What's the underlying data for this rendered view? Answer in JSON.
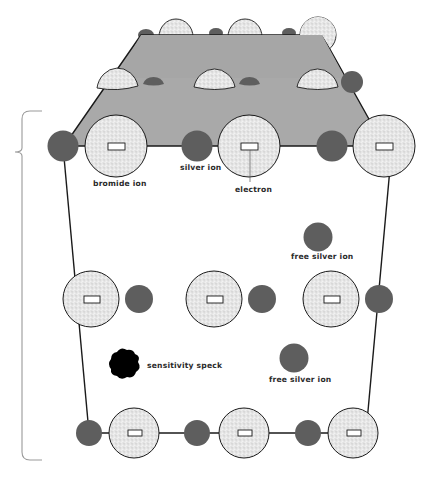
{
  "diagram": {
    "colors": {
      "silver_ion": "#5e5e5e",
      "bromide_ion_fill": "#ebebeb",
      "surface": "#a9a9a9",
      "outline": "#1a1a1a",
      "speck": "#000000",
      "brace": "#9a9a9a"
    },
    "labels": {
      "bromide_ion": "bromide ion",
      "silver_ion": "silver ion",
      "electron": "electron",
      "free_silver_ion_1": "free silver ion",
      "free_silver_ion_2": "free silver ion",
      "sensitivity_speck": "sensitivity speck"
    },
    "legend_items": [
      {
        "name": "bromide ion",
        "shape": "large stippled circle"
      },
      {
        "name": "silver ion",
        "shape": "small dark circle"
      },
      {
        "name": "electron",
        "shape": "small rectangle inside bromide ion"
      },
      {
        "name": "free silver ion",
        "shape": "isolated small dark circle"
      },
      {
        "name": "sensitivity speck",
        "shape": "black irregular blob"
      }
    ]
  }
}
